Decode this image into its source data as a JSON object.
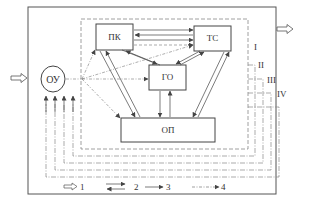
{
  "diagram": {
    "blocks": {
      "ou": "ОУ",
      "pk": "ПК",
      "ts": "ТС",
      "go": "ГО",
      "op": "ОП"
    },
    "levels": [
      "I",
      "II",
      "III",
      "IV"
    ],
    "legend": [
      {
        "id": "1",
        "label": "1",
        "style": "double-arrow"
      },
      {
        "id": "2",
        "label": "2",
        "style": "bidirectional-arrows"
      },
      {
        "id": "3",
        "label": "3",
        "style": "solid-arrow"
      },
      {
        "id": "4",
        "label": "4",
        "style": "dash-dot-arrow"
      }
    ],
    "colors": {
      "line": "#444444",
      "dashed": "#888888",
      "background": "#ffffff"
    }
  }
}
